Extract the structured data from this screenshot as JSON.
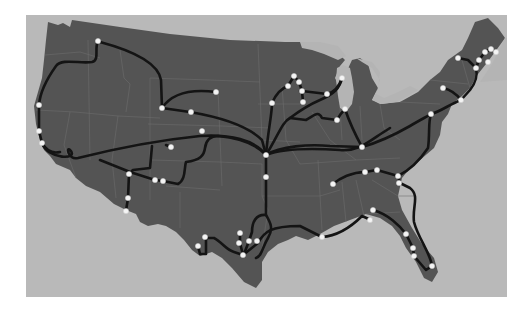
{
  "map": {
    "subject": "Continental United States rail route network",
    "colors": {
      "background": "#ffffff",
      "water": "#b9b9b9",
      "land": "#545454",
      "lakes": "#b4b4b4",
      "state_borders": "#6e6e6e",
      "routes": "#141414",
      "stations": "#f4f4f4"
    },
    "stations": [
      {
        "x": 98,
        "y": 41
      },
      {
        "x": 39,
        "y": 105
      },
      {
        "x": 39,
        "y": 131
      },
      {
        "x": 42,
        "y": 143
      },
      {
        "x": 162,
        "y": 108
      },
      {
        "x": 216,
        "y": 92
      },
      {
        "x": 191,
        "y": 112
      },
      {
        "x": 202,
        "y": 131
      },
      {
        "x": 171,
        "y": 147
      },
      {
        "x": 266,
        "y": 155
      },
      {
        "x": 266,
        "y": 177
      },
      {
        "x": 272,
        "y": 103
      },
      {
        "x": 288,
        "y": 86
      },
      {
        "x": 294,
        "y": 76
      },
      {
        "x": 299,
        "y": 82
      },
      {
        "x": 302,
        "y": 91
      },
      {
        "x": 303,
        "y": 102
      },
      {
        "x": 327,
        "y": 94
      },
      {
        "x": 342,
        "y": 78
      },
      {
        "x": 345,
        "y": 109
      },
      {
        "x": 337,
        "y": 120
      },
      {
        "x": 362,
        "y": 147
      },
      {
        "x": 431,
        "y": 114
      },
      {
        "x": 443,
        "y": 88
      },
      {
        "x": 461,
        "y": 100
      },
      {
        "x": 458,
        "y": 58
      },
      {
        "x": 476,
        "y": 68
      },
      {
        "x": 479,
        "y": 60
      },
      {
        "x": 485,
        "y": 52
      },
      {
        "x": 488,
        "y": 62
      },
      {
        "x": 491,
        "y": 49
      },
      {
        "x": 496,
        "y": 52
      },
      {
        "x": 333,
        "y": 184
      },
      {
        "x": 365,
        "y": 172
      },
      {
        "x": 377,
        "y": 170
      },
      {
        "x": 398,
        "y": 176
      },
      {
        "x": 399,
        "y": 183
      },
      {
        "x": 373,
        "y": 210
      },
      {
        "x": 370,
        "y": 220
      },
      {
        "x": 406,
        "y": 234
      },
      {
        "x": 413,
        "y": 248
      },
      {
        "x": 414,
        "y": 256
      },
      {
        "x": 432,
        "y": 266
      },
      {
        "x": 322,
        "y": 237
      },
      {
        "x": 129,
        "y": 174
      },
      {
        "x": 155,
        "y": 180
      },
      {
        "x": 163,
        "y": 181
      },
      {
        "x": 128,
        "y": 198
      },
      {
        "x": 126,
        "y": 211
      },
      {
        "x": 205,
        "y": 237
      },
      {
        "x": 198,
        "y": 246
      },
      {
        "x": 240,
        "y": 233
      },
      {
        "x": 239,
        "y": 243
      },
      {
        "x": 249,
        "y": 241
      },
      {
        "x": 257,
        "y": 241
      },
      {
        "x": 243,
        "y": 255
      }
    ]
  }
}
